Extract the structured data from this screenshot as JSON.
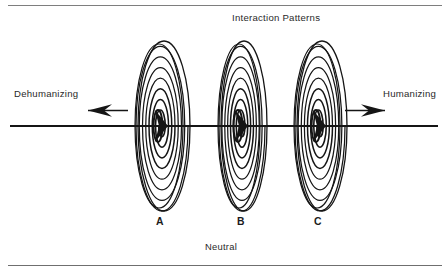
{
  "figure": {
    "type": "conceptual-diagram",
    "title": "Interaction Patterns",
    "axis": {
      "left_label": "Dehumanizing",
      "right_label": "Humanizing",
      "bottom_label": "Neutral",
      "left_arrow_icon": "arrow-left-icon",
      "right_arrow_icon": "arrow-right-icon",
      "line_color": "#151515"
    },
    "nodes": [
      {
        "id": "a",
        "label": "A",
        "center_x": 162,
        "center_y": 126,
        "rx": 26,
        "ry": 85,
        "rings": 8,
        "icon": "spiral-icon"
      },
      {
        "id": "b",
        "label": "B",
        "center_x": 242,
        "center_y": 126,
        "rx": 23,
        "ry": 85,
        "rings": 8,
        "icon": "spiral-icon"
      },
      {
        "id": "c",
        "label": "C",
        "center_x": 320,
        "center_y": 126,
        "rx": 25,
        "ry": 85,
        "rings": 8,
        "icon": "spiral-icon"
      }
    ],
    "colors": {
      "ink": "#151515",
      "rule": "#7e7e7e",
      "background": "#ffffff"
    }
  }
}
